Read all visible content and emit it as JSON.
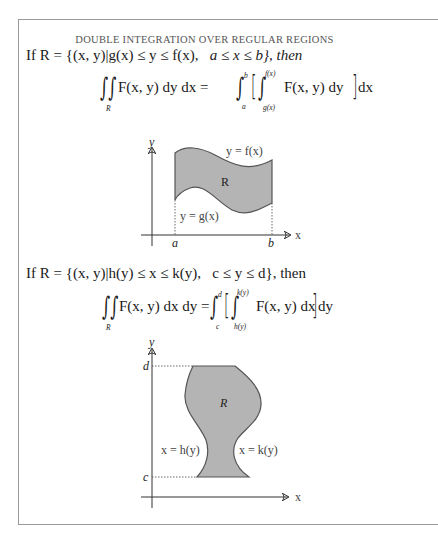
{
  "title": "DOUBLE INTEGRATION OVER REGULAR REGIONS",
  "section1": {
    "condition_prefix": "If R = {(x, y)|g(x) ≤ y ≤ f(x),",
    "condition_range": "a ≤ x ≤ b}, then",
    "lhs": "F(x, y) dy dx =",
    "region_sub": "R",
    "outer_upper": "b",
    "outer_lower": "a",
    "inner_upper": "f(x)",
    "inner_lower": "g(x)",
    "integrand": "F(x, y) dy",
    "outer_diff": "dx",
    "diagram": {
      "y_axis_label": "y",
      "x_axis_label": "x",
      "top_curve_label": "y = f(x)",
      "bottom_curve_label": "y = g(x)",
      "region_label": "R",
      "left_bound_label": "a",
      "right_bound_label": "b"
    }
  },
  "section2": {
    "condition_prefix": "If R = {(x, y)|h(y) ≤ x ≤ k(y),",
    "condition_range": "c ≤ y ≤ d}, then",
    "lhs": "F(x, y) dx dy =",
    "region_sub": "R",
    "outer_upper": "d",
    "outer_lower": "c",
    "inner_upper": "k(y)",
    "inner_lower": "h(y)",
    "integrand": "F(x, y) dx",
    "outer_diff": "dy",
    "diagram": {
      "y_axis_label": "y",
      "x_axis_label": "x",
      "left_curve_label": "x = h(y)",
      "right_curve_label": "x = k(y)",
      "region_label": "R",
      "top_bound_label": "d",
      "bottom_bound_label": "c"
    }
  },
  "colors": {
    "region_fill": "#b4b4b4",
    "region_stroke": "#555555",
    "frame": "#9a9a9a"
  }
}
